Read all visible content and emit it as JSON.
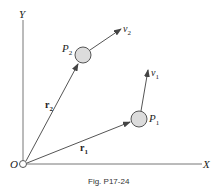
{
  "figure": {
    "caption": "Fig. P17-24",
    "axes": {
      "x_label": "X",
      "y_label": "Y",
      "origin_label": "O"
    },
    "points": [
      {
        "name": "P",
        "sub": "1",
        "velocity_name": "v",
        "velocity_sub": "1",
        "position_name": "r",
        "position_sub": "1"
      },
      {
        "name": "P",
        "sub": "2",
        "velocity_name": "v",
        "velocity_sub": "2",
        "position_name": "r",
        "position_sub": "2"
      }
    ],
    "colors": {
      "line": "#555555",
      "particle_fill": "#dcdcdc",
      "particle_stroke": "#555555"
    }
  }
}
